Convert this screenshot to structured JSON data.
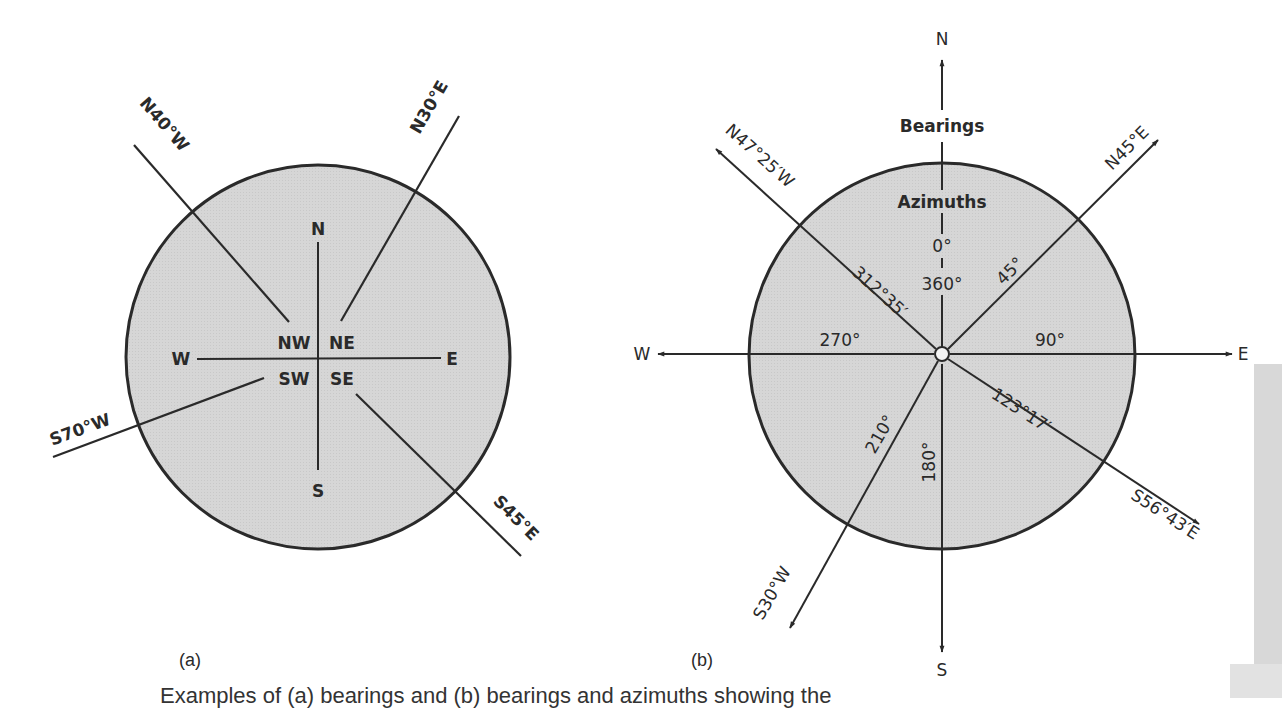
{
  "figure": {
    "panel_a": {
      "label": "(a)",
      "cardinals": {
        "north": "N",
        "south": "S",
        "east": "E",
        "west": "W"
      },
      "quadrants": {
        "ne": "NE",
        "nw": "NW",
        "se": "SE",
        "sw": "SW"
      },
      "bearings": [
        {
          "label": "N40°W",
          "azimuth_deg": 320
        },
        {
          "label": "N30°E",
          "azimuth_deg": 30
        },
        {
          "label": "S70°W",
          "azimuth_deg": 250
        },
        {
          "label": "S45°E",
          "azimuth_deg": 135
        }
      ]
    },
    "panel_b": {
      "label": "(b)",
      "cardinals": {
        "north": "N",
        "south": "S",
        "east": "E",
        "west": "W"
      },
      "headings": {
        "outer": "Bearings",
        "inner": "Azimuths"
      },
      "cardinal_azimuths": {
        "north_top": "0°",
        "north_bottom": "360°",
        "east": "90°",
        "south": "180°",
        "west": "270°"
      },
      "lines": [
        {
          "bearing": "N47°25′W",
          "azimuth": "312°35′",
          "azimuth_deg": 312.583
        },
        {
          "bearing": "N45°E",
          "azimuth": "45°",
          "azimuth_deg": 45
        },
        {
          "bearing": "S56°43′E",
          "azimuth": "123°17′",
          "azimuth_deg": 123.283
        },
        {
          "bearing": "S30°W",
          "azimuth": "210°",
          "azimuth_deg": 210
        }
      ]
    },
    "caption": "Examples of (a) bearings and (b) bearings and azimuths showing the"
  }
}
